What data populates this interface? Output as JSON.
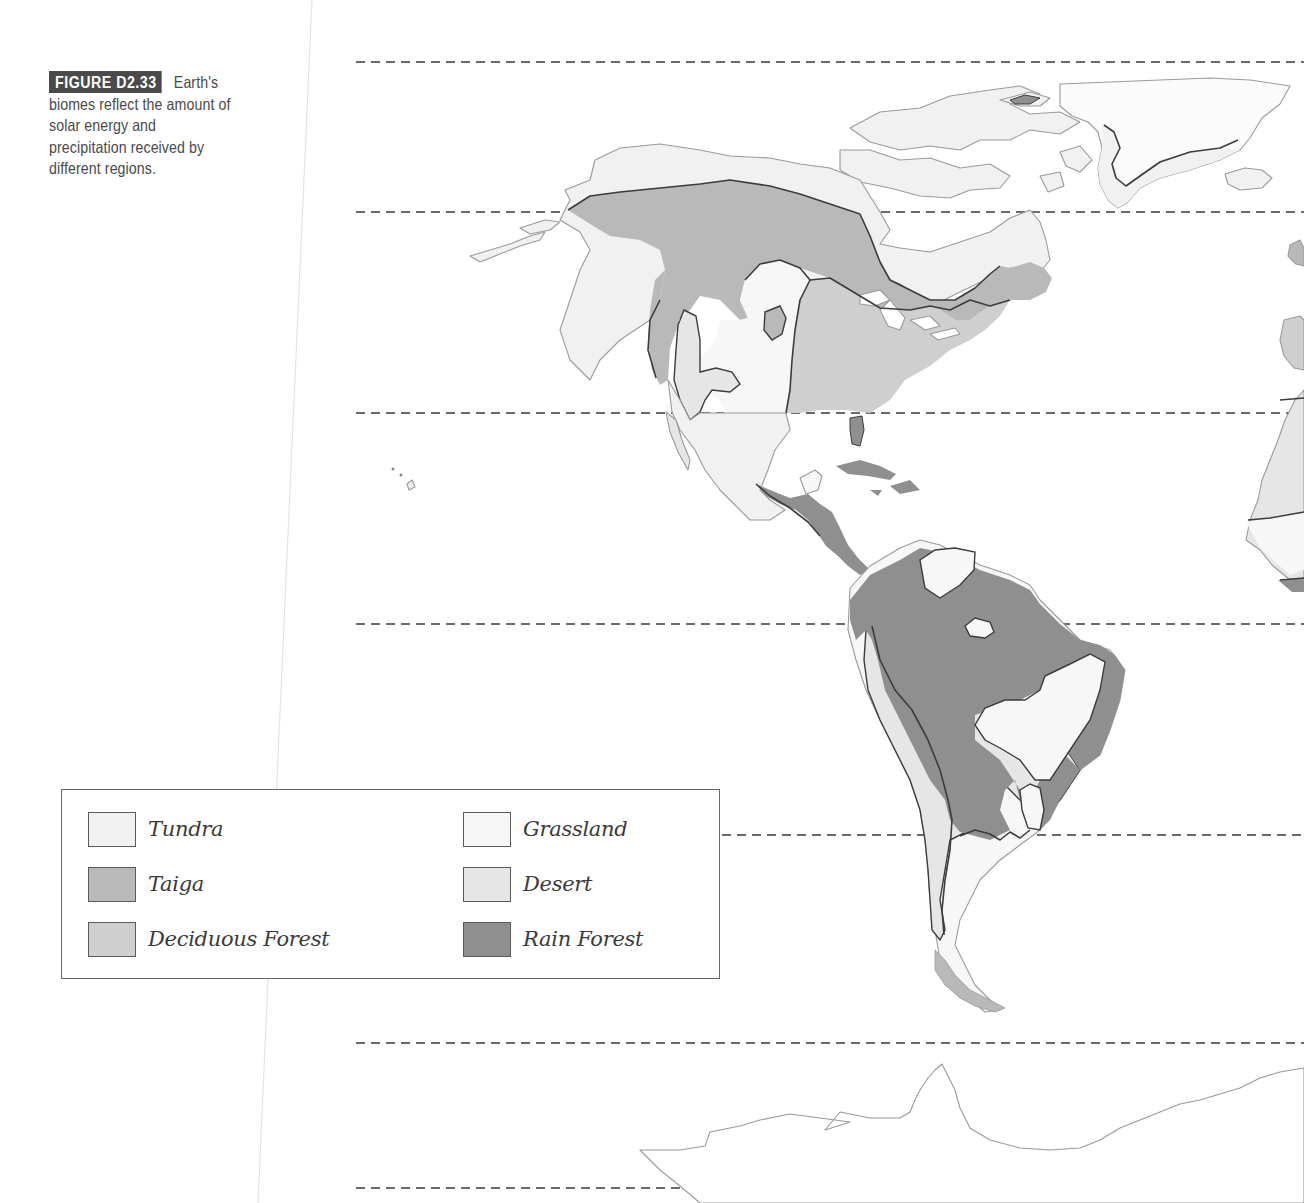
{
  "figure": {
    "label": "FIGURE D2.33",
    "caption_lines": [
      "Earth's",
      "biomes reflect the amount of",
      "solar energy and",
      "precipitation received by",
      "different regions."
    ]
  },
  "map": {
    "title": "Earth's biomes (Americas)",
    "latitude_line_y": [
      62,
      212,
      413,
      624,
      835,
      1043,
      1188
    ],
    "colors": {
      "tundra": "#f1f1f1",
      "taiga": "#b9b9b9",
      "deciduous_forest": "#cfcfcf",
      "grassland": "#f7f7f7",
      "desert": "#e6e6e6",
      "rain_forest": "#8f8f8f",
      "coastline": "#9a9a9a",
      "boundary": "#3c3c3c",
      "dash": "#3a3a3a"
    }
  },
  "legend": {
    "items": [
      {
        "id": "tundra",
        "label": "Tundra",
        "color": "#f1f1f1"
      },
      {
        "id": "taiga",
        "label": "Taiga",
        "color": "#b9b9b9"
      },
      {
        "id": "deciduous-forest",
        "label": "Deciduous Forest",
        "color": "#cfcfcf"
      },
      {
        "id": "grassland",
        "label": "Grassland",
        "color": "#f7f7f7"
      },
      {
        "id": "desert",
        "label": "Desert",
        "color": "#e6e6e6"
      },
      {
        "id": "rain-forest",
        "label": "Rain Forest",
        "color": "#8f8f8f"
      }
    ]
  }
}
